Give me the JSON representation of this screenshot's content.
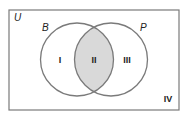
{
  "diagram": {
    "type": "venn",
    "universe": {
      "label": "U",
      "x": 9,
      "y": 10,
      "width": 170,
      "height": 100
    },
    "sets": [
      {
        "label": "B",
        "cx": 77,
        "cy": 59.5,
        "r": 36.5
      },
      {
        "label": "P",
        "cx": 111,
        "cy": 59.5,
        "r": 36.5
      }
    ],
    "regions": [
      {
        "label": "I",
        "description": "B only",
        "shaded": false
      },
      {
        "label": "II",
        "description": "B and P",
        "shaded": true
      },
      {
        "label": "III",
        "description": "P only",
        "shaded": false
      },
      {
        "label": "IV",
        "description": "neither B nor P",
        "shaded": false
      }
    ],
    "colors": {
      "stroke": "#7a7a7a",
      "shade": "#d9d9d9",
      "text": "#222222"
    }
  }
}
